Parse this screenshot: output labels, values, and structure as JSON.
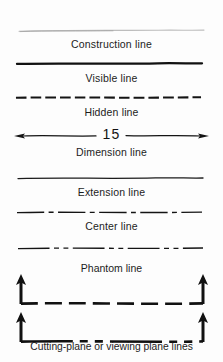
{
  "figure": {
    "background_color": "#fdfdfd",
    "ink_color": "#141414",
    "light_ink_color": "#b9b9b9"
  },
  "rows": [
    {
      "id": "construction",
      "label": "Construction line",
      "line_style": "thin-light-continuous",
      "weight": "thin",
      "color": "#b9b9b9"
    },
    {
      "id": "visible",
      "label": "Visible line",
      "line_style": "thick-continuous",
      "weight": "thick",
      "color": "#111111"
    },
    {
      "id": "hidden",
      "label": "Hidden line",
      "line_style": "short-dashes",
      "weight": "medium",
      "color": "#141414"
    },
    {
      "id": "dimension",
      "label": "Dimension line",
      "line_style": "continuous-with-arrowheads-and-break",
      "weight": "thin",
      "color": "#141414",
      "value": "15"
    },
    {
      "id": "extension",
      "label": "Extension line",
      "line_style": "thin-continuous",
      "weight": "thin",
      "color": "#1b1b1b"
    },
    {
      "id": "center",
      "label": "Center line",
      "line_style": "long-dash-short-dash",
      "weight": "thin",
      "color": "#141414"
    },
    {
      "id": "phantom",
      "label": "Phantom line",
      "line_style": "long-dash-two-short-dashes",
      "weight": "thin",
      "color": "#141414"
    },
    {
      "id": "cutting-plane",
      "label": "Cutting-plane or viewing plane lines",
      "line_style": "heavy-dashed-with-end-arrows",
      "weight": "thick",
      "color": "#111111",
      "variants": [
        {
          "id": "cutting-plane-a",
          "pattern": "uniform-long-dashes"
        },
        {
          "id": "cutting-plane-b",
          "pattern": "long-dash-two-short-dashes"
        }
      ]
    }
  ]
}
